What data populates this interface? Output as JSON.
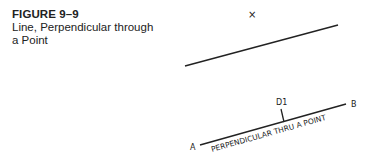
{
  "caption": {
    "number": "FIGURE 9–9",
    "title": "Line, Perpendicular through a Point"
  },
  "diagram": {
    "point_marker": "×",
    "upper_line": {
      "x1": 185,
      "y1": 66,
      "x2": 338,
      "y2": 25
    },
    "lower_line": {
      "x1": 200,
      "y1": 145,
      "x2": 346,
      "y2": 104
    },
    "endpoint_a": "A",
    "endpoint_b": "B",
    "point_label": "D1",
    "line_label": "PERPENDICULAR THRU A POINT",
    "line_color": "#222222"
  }
}
